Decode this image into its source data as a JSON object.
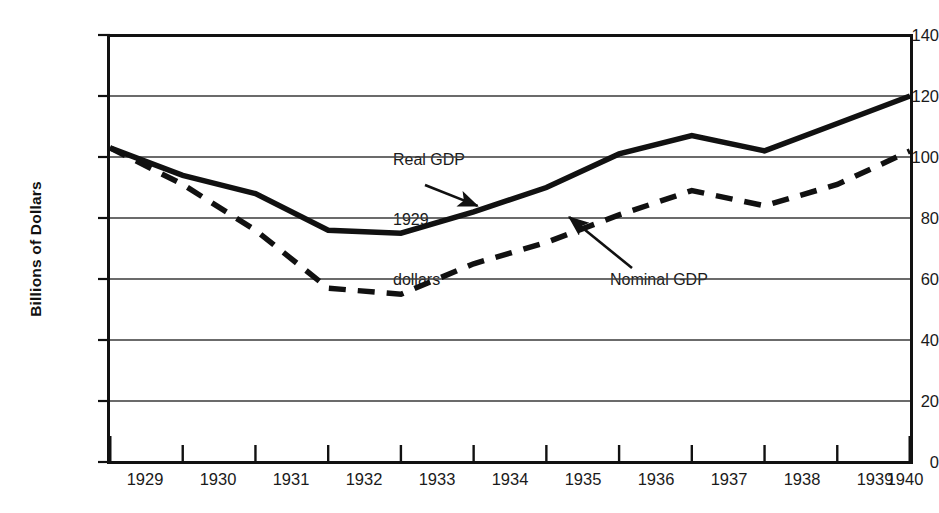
{
  "chart_data": {
    "type": "line",
    "title": "",
    "xlabel": "",
    "ylabel": "Billions of Dollars",
    "x": [
      1929,
      1930,
      1931,
      1932,
      1933,
      1934,
      1935,
      1936,
      1937,
      1938,
      1939,
      1940
    ],
    "xtick_labels": [
      "1929",
      "1930",
      "1931",
      "1932",
      "1933",
      "1934",
      "1935",
      "1936",
      "1937",
      "1938",
      "1939",
      "1940"
    ],
    "ytick_labels": [
      "0",
      "20",
      "40",
      "60",
      "80",
      "100",
      "120",
      "140"
    ],
    "yticks": [
      0,
      20,
      40,
      60,
      80,
      100,
      120,
      140
    ],
    "ylim": [
      0,
      140
    ],
    "xlim": [
      1929,
      1940
    ],
    "grid": true,
    "legend": "annotations",
    "series": [
      {
        "name": "Real GDP 1929 dollars",
        "style": "solid",
        "color": "#111111",
        "values": [
          103,
          94,
          88,
          76,
          75,
          82,
          90,
          101,
          107,
          102,
          111,
          120
        ]
      },
      {
        "name": "Nominal GDP",
        "style": "dashed",
        "color": "#111111",
        "values": [
          103,
          91,
          76,
          57,
          55,
          65,
          72,
          81,
          89,
          84,
          91,
          102
        ]
      }
    ],
    "annotations": [
      {
        "id": "real-gdp",
        "text": "Real GDP\n1929\ndollars",
        "lines": [
          "Real GDP",
          "1929",
          "dollars"
        ],
        "arrow_to_year": 1934,
        "arrow_to_value": 82
      },
      {
        "id": "nominal-gdp",
        "text": "Nominal GDP",
        "lines": [
          "Nominal GDP"
        ],
        "arrow_to_year": 1936,
        "arrow_to_value": 79
      }
    ]
  },
  "axis": {
    "y_title": "Billions of Dollars",
    "y_labels": [
      "140",
      "120",
      "100",
      "80",
      "60",
      "40",
      "20",
      "0"
    ],
    "x_labels": [
      "1929",
      "1930",
      "1931",
      "1932",
      "1933",
      "1934",
      "1935",
      "1936",
      "1937",
      "1938",
      "1939",
      "1940"
    ]
  },
  "annotations": {
    "real_gdp_line1": "Real GDP",
    "real_gdp_line2": "1929",
    "real_gdp_line3": "dollars",
    "nominal_gdp": "Nominal GDP"
  },
  "colors": {
    "ink": "#111111",
    "grid": "#3a3a3a",
    "background": "#ffffff"
  }
}
